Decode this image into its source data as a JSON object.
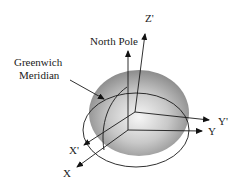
{
  "labels": {
    "z_prime": "Z'",
    "north_pole": "North Pole",
    "greenwich_line1": "Greenwich",
    "greenwich_line2": "Meridian",
    "y_prime": "Y'",
    "y": "Y",
    "x_prime": "X'",
    "x": "X"
  },
  "colors": {
    "sphere_light": "#f4f4f4",
    "sphere_dark": "#8a8a8a",
    "line": "#1a1a1a"
  }
}
